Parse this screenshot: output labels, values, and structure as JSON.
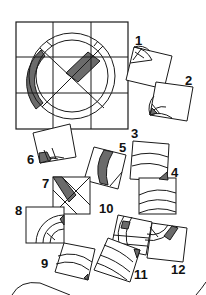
{
  "puzzle": {
    "title": "Which pieces complete the grid",
    "grid": {
      "rows": 3,
      "cols": 3
    },
    "colors": {
      "ink": "#1a1a1a",
      "shade": "#6b6b6b",
      "paper": "#ffffff"
    },
    "pieces": [
      {
        "id": 1,
        "label": "1"
      },
      {
        "id": 2,
        "label": "2"
      },
      {
        "id": 3,
        "label": "3"
      },
      {
        "id": 4,
        "label": "4"
      },
      {
        "id": 5,
        "label": "5"
      },
      {
        "id": 6,
        "label": "6"
      },
      {
        "id": 7,
        "label": "7"
      },
      {
        "id": 8,
        "label": "8"
      },
      {
        "id": 9,
        "label": "9"
      },
      {
        "id": 10,
        "label": "10"
      },
      {
        "id": 11,
        "label": "11"
      },
      {
        "id": 12,
        "label": "12"
      }
    ]
  }
}
